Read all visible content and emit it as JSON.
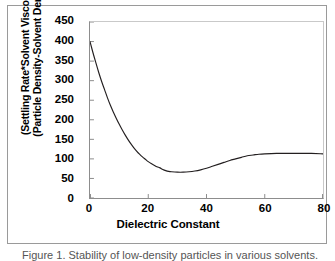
{
  "figure": {
    "caption": "Figure 1. Stability of low-density particles in various solvents."
  },
  "chart_data": {
    "type": "line",
    "title": "",
    "xlabel": "Dielectric Constant",
    "ylabel_line1": "(Settling Rate*Solvent Viscosity)/",
    "ylabel_line2": "(Particle Density-Solvent Density)",
    "xlim": [
      0,
      80
    ],
    "ylim": [
      0,
      450
    ],
    "xticks": [
      0,
      20,
      40,
      60,
      80
    ],
    "yticks": [
      0,
      50,
      100,
      150,
      200,
      250,
      300,
      350,
      400,
      450
    ],
    "grid": false,
    "legend": false,
    "line_color": "#231f20",
    "series": [
      {
        "name": "Settling parameter",
        "x": [
          0,
          1,
          2,
          3,
          4,
          5,
          6,
          7,
          8,
          9,
          10,
          11,
          12,
          13,
          14,
          15,
          16,
          17,
          18,
          19,
          20,
          21,
          22,
          23,
          24,
          25,
          26,
          27,
          28,
          30,
          32,
          34,
          36,
          38,
          40,
          42,
          44,
          46,
          48,
          50,
          52,
          54,
          56,
          58,
          60,
          64,
          68,
          72,
          76,
          80
        ],
        "y": [
          400,
          372,
          346,
          321,
          298,
          277,
          256,
          237,
          220,
          204,
          189,
          175,
          162,
          150,
          139,
          129,
          120,
          112,
          105,
          99,
          93,
          88,
          84,
          80,
          77,
          73,
          70,
          68,
          67,
          66,
          66,
          67,
          69,
          72,
          76,
          81,
          86,
          91,
          96,
          100,
          104,
          108,
          110,
          112,
          113,
          114,
          114,
          114,
          114,
          113
        ]
      }
    ]
  }
}
